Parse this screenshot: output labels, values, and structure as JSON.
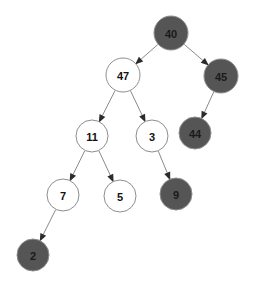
{
  "diagram": {
    "type": "binary-tree",
    "background_color": "#ffffff",
    "palette": {
      "node_dark_fill": "#555555",
      "node_light_fill": "#ffffff",
      "node_stroke": "#8e8e8e",
      "edge_color": "#8a8a8a",
      "arrow_color": "#2b2b2b",
      "label_dark_text": "#111111",
      "label_light_text": "#111111"
    },
    "node_radius": 16,
    "nodes": [
      {
        "id": "n40",
        "label": "40",
        "cx": 171,
        "cy": 33,
        "r": 17,
        "fill": "#555555",
        "text_color": "#1a1a1a",
        "style": "dark",
        "depth": 0
      },
      {
        "id": "n47",
        "label": "47",
        "cx": 123,
        "cy": 75,
        "r": 17,
        "fill": "#ffffff",
        "text_color": "#111111",
        "style": "light",
        "depth": 1
      },
      {
        "id": "n45",
        "label": "45",
        "cx": 221,
        "cy": 76,
        "r": 17,
        "fill": "#555555",
        "text_color": "#1a1a1a",
        "style": "dark",
        "depth": 1
      },
      {
        "id": "n11",
        "label": "11",
        "cx": 92,
        "cy": 136,
        "r": 16,
        "fill": "#ffffff",
        "text_color": "#111111",
        "style": "light",
        "depth": 2
      },
      {
        "id": "n3",
        "label": "3",
        "cx": 152,
        "cy": 136,
        "r": 16,
        "fill": "#ffffff",
        "text_color": "#111111",
        "style": "light",
        "depth": 2
      },
      {
        "id": "n44",
        "label": "44",
        "cx": 195,
        "cy": 133,
        "r": 16,
        "fill": "#555555",
        "text_color": "#1a1a1a",
        "style": "dark",
        "depth": 2
      },
      {
        "id": "n7",
        "label": "7",
        "cx": 63,
        "cy": 195,
        "r": 16,
        "fill": "#ffffff",
        "text_color": "#111111",
        "style": "light",
        "depth": 3
      },
      {
        "id": "n5",
        "label": "5",
        "cx": 120,
        "cy": 196,
        "r": 16,
        "fill": "#ffffff",
        "text_color": "#111111",
        "style": "light",
        "depth": 3
      },
      {
        "id": "n9",
        "label": "9",
        "cx": 176,
        "cy": 194,
        "r": 16,
        "fill": "#555555",
        "text_color": "#1a1a1a",
        "style": "dark",
        "depth": 3
      },
      {
        "id": "n2",
        "label": "2",
        "cx": 33,
        "cy": 255,
        "r": 16,
        "fill": "#555555",
        "text_color": "#1a1a1a",
        "style": "dark",
        "depth": 4
      }
    ],
    "edges": [
      {
        "id": "e40-47",
        "from": "n40",
        "to": "n47",
        "directed": true
      },
      {
        "id": "e40-45",
        "from": "n40",
        "to": "n45",
        "directed": true
      },
      {
        "id": "e47-11",
        "from": "n47",
        "to": "n11",
        "directed": true
      },
      {
        "id": "e47-3",
        "from": "n47",
        "to": "n3",
        "directed": true
      },
      {
        "id": "e45-44",
        "from": "n45",
        "to": "n44",
        "directed": true
      },
      {
        "id": "e11-7",
        "from": "n11",
        "to": "n7",
        "directed": true
      },
      {
        "id": "e11-5",
        "from": "n11",
        "to": "n5",
        "directed": true
      },
      {
        "id": "e3-9",
        "from": "n3",
        "to": "n9",
        "directed": true
      },
      {
        "id": "e7-2",
        "from": "n7",
        "to": "n2",
        "directed": true
      }
    ]
  }
}
